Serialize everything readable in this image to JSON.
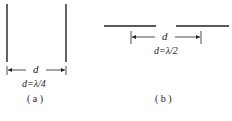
{
  "figure_a": {
    "arrow_label": "d",
    "formula": "d=λ/4",
    "caption": "( a )"
  },
  "figure_b": {
    "arrow_label": "d",
    "formula": "d=λ/2",
    "caption": "( b )"
  },
  "colors": {
    "line": "#222222",
    "background": "#ffffff"
  }
}
